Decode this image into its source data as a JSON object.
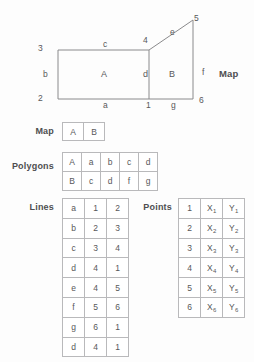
{
  "diagram": {
    "title": "Map",
    "node_labels": [
      {
        "text": "3",
        "x": 38,
        "y": 44
      },
      {
        "text": "2",
        "x": 38,
        "y": 94
      },
      {
        "text": "4",
        "x": 143,
        "y": 36
      },
      {
        "text": "5",
        "x": 194,
        "y": 14
      },
      {
        "text": "1",
        "x": 146,
        "y": 101
      },
      {
        "text": "6",
        "x": 199,
        "y": 96
      }
    ],
    "edge_labels": [
      {
        "text": "c",
        "x": 103,
        "y": 40
      },
      {
        "text": "e",
        "x": 170,
        "y": 28
      },
      {
        "text": "b",
        "x": 43,
        "y": 70
      },
      {
        "text": "f",
        "x": 202,
        "y": 68
      },
      {
        "text": "a",
        "x": 103,
        "y": 101
      },
      {
        "text": "g",
        "x": 171,
        "y": 101
      }
    ],
    "face_labels": [
      {
        "text": "A",
        "x": 101,
        "y": 70
      },
      {
        "text": "d",
        "x": 143,
        "y": 70
      },
      {
        "text": "B",
        "x": 169,
        "y": 70
      }
    ]
  },
  "sections": {
    "map_label": "Map",
    "polygons_label": "Polygons",
    "lines_label": "Lines",
    "points_label": "Points"
  },
  "map_table": {
    "rows": [
      [
        "A",
        "B"
      ]
    ]
  },
  "polygons_table": {
    "rows": [
      [
        "A",
        "a",
        "b",
        "c",
        "d"
      ],
      [
        "B",
        "c",
        "d",
        "f",
        "g"
      ]
    ]
  },
  "lines_table": {
    "rows": [
      [
        "a",
        "1",
        "2"
      ],
      [
        "b",
        "2",
        "3"
      ],
      [
        "c",
        "3",
        "4"
      ],
      [
        "d",
        "4",
        "1"
      ],
      [
        "e",
        "4",
        "5"
      ],
      [
        "f",
        "5",
        "6"
      ],
      [
        "g",
        "6",
        "1"
      ],
      [
        "d",
        "4",
        "1"
      ]
    ]
  },
  "points_table": {
    "rows": [
      [
        "1",
        "X",
        "1",
        "Y",
        "1"
      ],
      [
        "2",
        "X",
        "2",
        "Y",
        "2"
      ],
      [
        "3",
        "X",
        "3",
        "Y",
        "3"
      ],
      [
        "4",
        "X",
        "4",
        "Y",
        "4"
      ],
      [
        "5",
        "X",
        "5",
        "Y",
        "5"
      ],
      [
        "6",
        "X",
        "6",
        "Y",
        "6"
      ]
    ]
  },
  "colors": {
    "stroke": "#8a8a8c",
    "text": "#58585a",
    "background": "#fdfdfd"
  }
}
